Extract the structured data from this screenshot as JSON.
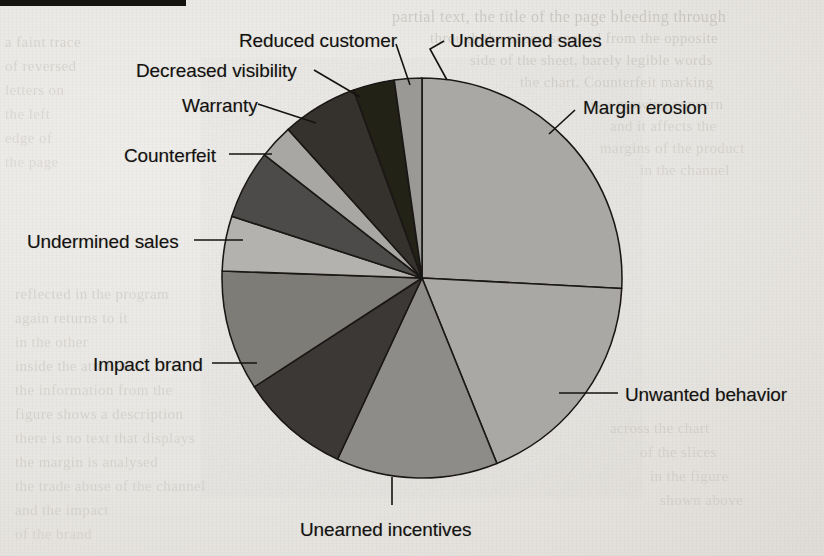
{
  "page": {
    "background_color": "#e9e7e3",
    "top_rule_color": "#15140f",
    "ghost_text": [
      {
        "t": "partial text, the title of the page bleeding through",
        "x": 392,
        "y": 8,
        "size": 16,
        "op": 0.2
      },
      {
        "t": "through the paper, scanned from the opposite",
        "x": 430,
        "y": 30,
        "size": 15,
        "op": 0.17
      },
      {
        "t": "side of the sheet, barely legible words",
        "x": 470,
        "y": 52,
        "size": 15,
        "op": 0.16
      },
      {
        "t": "the chart. Counterfeit marking",
        "x": 520,
        "y": 74,
        "size": 15,
        "op": 0.15
      },
      {
        "t": "is a growing concern",
        "x": 590,
        "y": 96,
        "size": 15,
        "op": 0.14
      },
      {
        "t": "and it affects the",
        "x": 610,
        "y": 118,
        "size": 15,
        "op": 0.13
      },
      {
        "t": "margins of the product",
        "x": 600,
        "y": 140,
        "size": 15,
        "op": 0.13
      },
      {
        "t": "in the channel",
        "x": 640,
        "y": 162,
        "size": 15,
        "op": 0.12
      },
      {
        "t": "a faint trace",
        "x": 5,
        "y": 34,
        "size": 15,
        "op": 0.15
      },
      {
        "t": "of reversed",
        "x": 5,
        "y": 58,
        "size": 15,
        "op": 0.14
      },
      {
        "t": "letters on",
        "x": 5,
        "y": 82,
        "size": 15,
        "op": 0.13
      },
      {
        "t": "the left",
        "x": 5,
        "y": 106,
        "size": 15,
        "op": 0.12
      },
      {
        "t": "edge of",
        "x": 5,
        "y": 130,
        "size": 15,
        "op": 0.12
      },
      {
        "t": "the page",
        "x": 5,
        "y": 154,
        "size": 15,
        "op": 0.11
      },
      {
        "t": "reflected in the program",
        "x": 15,
        "y": 286,
        "size": 15,
        "op": 0.15
      },
      {
        "t": "again returns to it",
        "x": 15,
        "y": 310,
        "size": 15,
        "op": 0.14
      },
      {
        "t": "in the other",
        "x": 15,
        "y": 334,
        "size": 15,
        "op": 0.13
      },
      {
        "t": "inside the attributes",
        "x": 15,
        "y": 358,
        "size": 15,
        "op": 0.14
      },
      {
        "t": "the information from the",
        "x": 15,
        "y": 382,
        "size": 15,
        "op": 0.13
      },
      {
        "t": "figure shows a description",
        "x": 15,
        "y": 406,
        "size": 15,
        "op": 0.14
      },
      {
        "t": "there is no text that displays",
        "x": 15,
        "y": 430,
        "size": 15,
        "op": 0.13
      },
      {
        "t": "the margin is analysed",
        "x": 15,
        "y": 454,
        "size": 15,
        "op": 0.13
      },
      {
        "t": "the trade abuse of the channel",
        "x": 15,
        "y": 478,
        "size": 15,
        "op": 0.12
      },
      {
        "t": "and the impact",
        "x": 15,
        "y": 502,
        "size": 15,
        "op": 0.12
      },
      {
        "t": "of the brand",
        "x": 15,
        "y": 526,
        "size": 15,
        "op": 0.11
      },
      {
        "t": "across the chart",
        "x": 610,
        "y": 420,
        "size": 15,
        "op": 0.12
      },
      {
        "t": "of the slices",
        "x": 640,
        "y": 444,
        "size": 15,
        "op": 0.12
      },
      {
        "t": "in the figure",
        "x": 650,
        "y": 468,
        "size": 15,
        "op": 0.11
      },
      {
        "t": "shown above",
        "x": 660,
        "y": 492,
        "size": 15,
        "op": 0.11
      }
    ]
  },
  "chart_data": {
    "type": "pie",
    "title": "",
    "subtitle": "",
    "xlabel": "",
    "ylabel": "",
    "legend_position": "callout-labels",
    "grid": false,
    "center": {
      "x": 422,
      "y": 278
    },
    "radius": 200,
    "start_angle_deg": 0,
    "direction": "clockwise",
    "units": "percent",
    "slices": [
      {
        "label": "Margin erosion",
        "value": 25.8,
        "start_deg": 0.0,
        "end_deg": 93.0,
        "color": "#aaa8a4"
      },
      {
        "label": "Unwanted behavior",
        "value": 18.1,
        "start_deg": 93.0,
        "end_deg": 158.0,
        "color": "#aaa8a4"
      },
      {
        "label": "Unearned incentives",
        "value": 13.1,
        "start_deg": 158.0,
        "end_deg": 205.0,
        "color": "#8e8c88"
      },
      {
        "label": "Impact brand",
        "value": 8.9,
        "start_deg": 205.0,
        "end_deg": 237.0,
        "color": "#3a3835"
      },
      {
        "label": "Undermined sales",
        "value": 9.7,
        "start_deg": 237.0,
        "end_deg": 272.0,
        "color": "#7d7b77"
      },
      {
        "label": "Counterfeit",
        "value": 4.4,
        "start_deg": 272.0,
        "end_deg": 288.0,
        "color": "#b4b2ae"
      },
      {
        "label": "Warranty",
        "value": 5.6,
        "start_deg": 288.0,
        "end_deg": 308.0,
        "color": "#4e4c49"
      },
      {
        "label": "Decreased visibility",
        "value": 2.8,
        "start_deg": 308.0,
        "end_deg": 318.0,
        "color": "#a9a7a3"
      },
      {
        "label": "Reduced customer",
        "value": 6.1,
        "start_deg": 318.0,
        "end_deg": 340.0,
        "color": "#35332f"
      },
      {
        "label": "Undermined sales",
        "value": 3.3,
        "start_deg": 340.0,
        "end_deg": 352.0,
        "color": "#222019"
      },
      {
        "label": "",
        "value": 2.2,
        "start_deg": 352.0,
        "end_deg": 360.0,
        "color": "#9b9995"
      }
    ],
    "callouts": [
      {
        "name": "margin-erosion",
        "text": "Margin erosion",
        "tx": 583,
        "ty": 97,
        "anchor": "start",
        "leader": [
          [
            575,
            110
          ],
          [
            549,
            134
          ]
        ]
      },
      {
        "name": "unwanted-behavior",
        "text": "Unwanted behavior",
        "tx": 625,
        "ty": 384,
        "anchor": "start",
        "leader": [
          [
            618,
            393
          ],
          [
            559,
            393
          ]
        ]
      },
      {
        "name": "unearned-incentives",
        "text": "Unearned incentives",
        "tx": 300,
        "ty": 519,
        "anchor": "start",
        "leader": [
          [
            392,
            505
          ],
          [
            392,
            477
          ]
        ]
      },
      {
        "name": "impact-brand",
        "text": "Impact brand",
        "tx": 93,
        "ty": 354,
        "anchor": "start",
        "leader": [
          [
            212,
            363
          ],
          [
            257,
            363
          ]
        ]
      },
      {
        "name": "undermined-sales-left",
        "text": "Undermined sales",
        "tx": 27,
        "ty": 231,
        "anchor": "start",
        "leader": [
          [
            194,
            240
          ],
          [
            243,
            240
          ]
        ]
      },
      {
        "name": "counterfeit",
        "text": "Counterfeit",
        "tx": 124,
        "ty": 145,
        "anchor": "start",
        "leader": [
          [
            229,
            154
          ],
          [
            272,
            154
          ]
        ]
      },
      {
        "name": "warranty",
        "text": "Warranty",
        "tx": 182,
        "ty": 95,
        "anchor": "start",
        "leader": [
          [
            258,
            104
          ],
          [
            316,
            123
          ]
        ]
      },
      {
        "name": "decreased-visibility",
        "text": "Decreased visibility",
        "tx": 136,
        "ty": 60,
        "anchor": "start",
        "leader": [
          [
            314,
            70
          ],
          [
            360,
            97
          ]
        ]
      },
      {
        "name": "reduced-customer",
        "text": "Reduced customer",
        "tx": 239,
        "ty": 30,
        "anchor": "start",
        "leader": [
          [
            396,
            44
          ],
          [
            410,
            85
          ]
        ]
      },
      {
        "name": "undermined-sales-top",
        "text": "Undermined sales",
        "tx": 450,
        "ty": 30,
        "anchor": "start",
        "leader": [
          [
            444,
            41
          ],
          [
            430,
            49
          ],
          [
            447,
            80
          ]
        ]
      }
    ]
  }
}
